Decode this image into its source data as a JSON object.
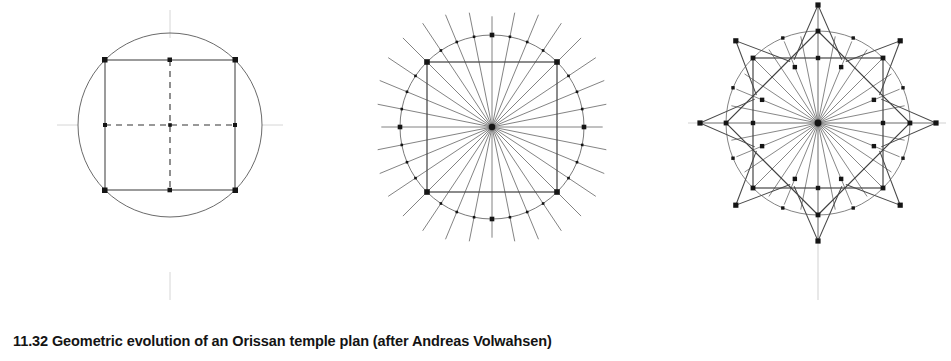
{
  "figure": {
    "caption_number": "11.32",
    "caption_text": "Geometric evolution of an Orissan temple plan (after Andreas Volwahsen)",
    "caption_full": "11.32 Geometric evolution of an Orissan temple plan (after Andreas Volwahsen)",
    "background_color": "#ffffff",
    "ink_color": "#3a3a3a",
    "node_color": "#1a1a1a",
    "axis_color": "#b8b8b8"
  },
  "chart_data": {
    "type": "diagram",
    "title": "Geometric evolution of an Orissan temple plan",
    "subtitle": "after Andreas Volwahsen",
    "panels": [
      {
        "index": 1,
        "name": "circle-with-inscribed-square",
        "label": "Stage 1",
        "center": [
          170,
          180
        ],
        "circle_radius": 92,
        "square_half_side": 65,
        "square_vertices": [
          [
            105,
            115
          ],
          [
            235,
            115
          ],
          [
            235,
            245
          ],
          [
            105,
            245
          ]
        ],
        "axes": [
          "vertical-dashed",
          "horizontal-dashed"
        ],
        "axis_overhang": 22,
        "node_count": 8,
        "radial_spokes": 0
      },
      {
        "index": 2,
        "name": "circle-square-with-32-radials",
        "label": "Stage 2",
        "center": [
          492,
          182
        ],
        "circle_radius": 92,
        "square_half_side": 65,
        "square_vertices": [
          [
            427,
            117
          ],
          [
            557,
            117
          ],
          [
            557,
            247
          ],
          [
            427,
            247
          ]
        ],
        "radial_spokes": 32,
        "spoke_outer_overhang": 34,
        "node_count": 32
      },
      {
        "index": 3,
        "name": "stellate-temple-plan",
        "label": "Stage 3",
        "center": [
          818,
          178
        ],
        "circle_radius": 92,
        "square_half_side": 65,
        "rotated_square_angles_deg": [
          0,
          45
        ],
        "star_points": 8,
        "star_outer_radius": 118,
        "radial_spokes": 32,
        "node_count": 40
      }
    ],
    "grid": false,
    "legend": null
  }
}
